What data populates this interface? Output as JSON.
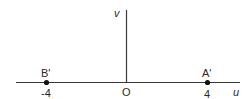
{
  "diagram": {
    "type": "complex-plane",
    "axes": {
      "horizontal_label": "u",
      "vertical_label": "v",
      "origin_label": "O"
    },
    "points": [
      {
        "label": "B'",
        "value_label": "-4",
        "x": -4
      },
      {
        "label": "A'",
        "value_label": "4",
        "x": 4
      }
    ],
    "colors": {
      "axis": "#3a3a3a",
      "point": "#111111",
      "text": "#2a2a2a"
    }
  }
}
